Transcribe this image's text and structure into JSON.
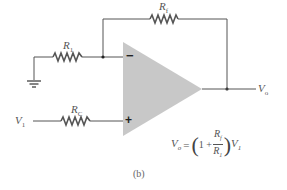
{
  "figure": {
    "caption": "(b)",
    "type": "non-inverting op-amp amplifier"
  },
  "components": {
    "rf": {
      "name": "R",
      "sub": "f"
    },
    "r1": {
      "name": "R",
      "sub": "1"
    },
    "rc": {
      "name": "R",
      "sub": "C"
    },
    "opamp": {
      "minus": "−",
      "plus": "+"
    },
    "input": {
      "name": "V",
      "sub": "1"
    },
    "output": {
      "name": "V",
      "sub": "o"
    }
  },
  "formula": {
    "lhs_name": "V",
    "lhs_sub": "o",
    "equals": "=",
    "open_paren": "(",
    "one": "1 +",
    "num_name": "R",
    "num_sub": "f",
    "den_name": "R",
    "den_sub": "1",
    "close_paren": ")",
    "rhs_name": "V",
    "rhs_sub": "1"
  },
  "colors": {
    "wire": "#555555",
    "opamp_fill": "#c8c8c8",
    "background": "#ffffff"
  }
}
